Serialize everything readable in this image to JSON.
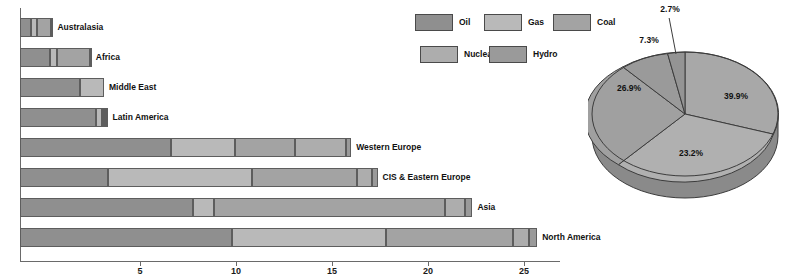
{
  "chart_data": [
    {
      "type": "bar",
      "orientation": "horizontal",
      "stacked": true,
      "title": "",
      "xlabel": "",
      "ylabel": "",
      "xlim": [
        0,
        22.5
      ],
      "xticks": [
        5,
        10,
        15,
        20,
        25
      ],
      "grid": false,
      "legend_position": "top-center",
      "categories": [
        "Australasia",
        "Africa",
        "Middle East",
        "Latin America",
        "Western Europe",
        "CIS & Eastern Europe",
        "Asia",
        "North America"
      ],
      "series": [
        {
          "name": "Oil",
          "color": "#8f8f8f",
          "values": [
            0.45,
            1.25,
            2.5,
            3.15,
            6.3,
            3.65,
            7.2,
            8.85
          ]
        },
        {
          "name": "Gas",
          "color": "#b9b9b9",
          "values": [
            0.25,
            0.3,
            1.0,
            0.25,
            2.65,
            6.0,
            0.9,
            6.4
          ]
        },
        {
          "name": "Coal",
          "color": "#a3a3a3",
          "values": [
            0.6,
            1.35,
            0.0,
            0.1,
            2.5,
            4.4,
            9.6,
            5.3
          ]
        },
        {
          "name": "Nuclear",
          "color": "#adadad",
          "values": [
            0.0,
            0.0,
            0.0,
            0.1,
            2.15,
            0.6,
            0.85,
            0.65
          ]
        },
        {
          "name": "Hydro",
          "color": "#9a9a9a",
          "values": [
            0.05,
            0.05,
            0.0,
            0.05,
            0.2,
            0.25,
            0.3,
            0.35
          ]
        }
      ]
    },
    {
      "type": "pie",
      "title": "",
      "labels": [
        "Oil",
        "Gas",
        "Coal",
        "Nuclear",
        "Hydro"
      ],
      "values": [
        39.9,
        23.2,
        26.9,
        7.3,
        2.7
      ],
      "value_labels": [
        "39.9%",
        "23.2%",
        "26.9%",
        "7.3%",
        "2.7%"
      ],
      "colors": [
        "#a8a8a8",
        "#b0b0b0",
        "#a0a0a0",
        "#9a9a9a",
        "#949494"
      ],
      "style": "3d"
    }
  ],
  "legend": {
    "items": [
      {
        "label": "Oil",
        "color": "#8f8f8f"
      },
      {
        "label": "Gas",
        "color": "#b9b9b9"
      },
      {
        "label": "Coal",
        "color": "#a3a3a3"
      },
      {
        "label": "Nuclear",
        "color": "#adadad"
      },
      {
        "label": "Hydro",
        "color": "#9a9a9a"
      }
    ]
  },
  "axis": {
    "ticks": [
      "5",
      "10",
      "15",
      "20",
      "25"
    ]
  },
  "bars": {
    "labels": [
      "Australasia",
      "Africa",
      "Middle East",
      "Latin America",
      "Western Europe",
      "CIS & Eastern Europe",
      "Asia",
      "North America"
    ]
  },
  "pie": {
    "percents": [
      "2.7%",
      "7.3%",
      "26.9%",
      "23.2%",
      "39.9%"
    ]
  }
}
